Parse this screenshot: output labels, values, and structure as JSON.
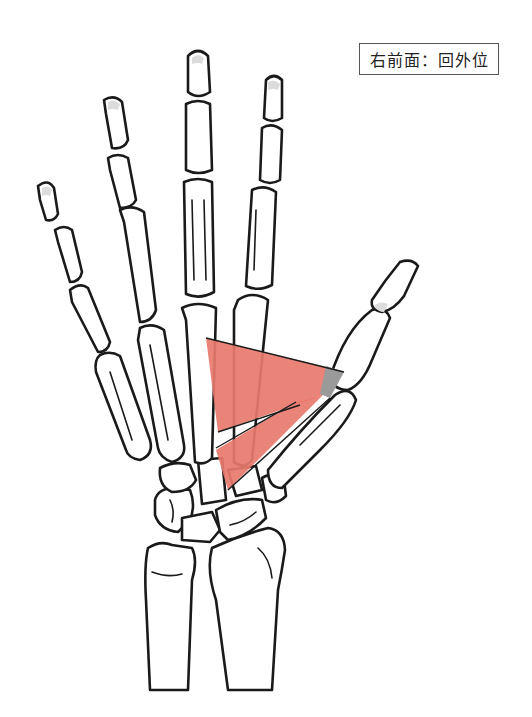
{
  "figure": {
    "label": "右前面：回外位",
    "highlighted_structure": "adductor-pollicis-muscle",
    "colors": {
      "muscle": "#e8796c",
      "tendon": "#9a9a9a",
      "outline": "#1a1a1a",
      "background": "#ffffff"
    }
  }
}
